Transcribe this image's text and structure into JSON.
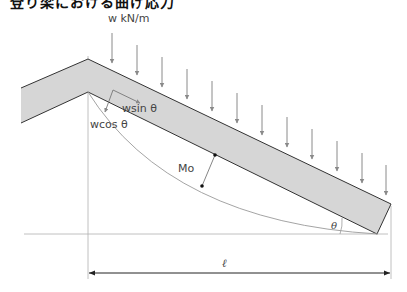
{
  "title": "登り梁における曲げ応力",
  "labels": {
    "load": "w kN/m",
    "wsin": "wsin θ",
    "wcos": "wcos θ",
    "moment": "Mo",
    "angle": "θ",
    "span": "ℓ"
  },
  "colors": {
    "beam_fill": "#d6d6d6",
    "beam_stroke": "#333333",
    "arrow": "#8a8a8a",
    "line": "#9a9a9a",
    "text": "#444444"
  },
  "load_arrows": {
    "count": 12
  }
}
